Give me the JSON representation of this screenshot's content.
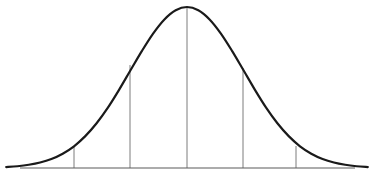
{
  "figure": {
    "background_color": "#ffffff",
    "width": 369,
    "height": 177
  },
  "style": {
    "curve_color": "#1a1a1a",
    "curve_width": 2.2,
    "baseline_color": "#5a5a5a",
    "baseline_width": 1.1,
    "gridline_color": "#6e6e6e",
    "gridline_width": 0.9
  },
  "geometry": {
    "baseline_y": 168,
    "baseline_x_start": 20,
    "baseline_x_end": 355,
    "peak_x": 187,
    "peak_y": 7,
    "curve_x_start": 17,
    "curve_x_end": 360,
    "sigma_px": 56.5
  },
  "chart_data": {
    "type": "line",
    "title": "",
    "subtitle": "",
    "xlabel": "",
    "ylabel": "",
    "legend": [],
    "legend_position": "none",
    "grid": false,
    "xlim": [
      -3.2,
      3.2
    ],
    "ylim": [
      0,
      1
    ],
    "annotations": [],
    "gridlines": {
      "orientation": "vertical",
      "label": "standard deviation markers",
      "x": [
        -2,
        -1,
        0,
        1,
        2
      ],
      "x_px": [
        74,
        130,
        187,
        243,
        296
      ],
      "top_y_px": [
        146,
        65,
        7,
        68,
        146
      ],
      "tick_labels": [
        "",
        "",
        "",
        "",
        ""
      ]
    },
    "series": [
      {
        "name": "normal-pdf",
        "x": [
          -3.2,
          -3.0,
          -2.8,
          -2.6,
          -2.4,
          -2.2,
          -2.0,
          -1.8,
          -1.6,
          -1.4,
          -1.2,
          -1.0,
          -0.8,
          -0.6,
          -0.4,
          -0.2,
          0.0,
          0.2,
          0.4,
          0.6,
          0.8,
          1.0,
          1.2,
          1.4,
          1.6,
          1.8,
          2.0,
          2.2,
          2.4,
          2.6,
          2.8,
          3.0,
          3.2
        ],
        "y": [
          0.006,
          0.011,
          0.02,
          0.034,
          0.056,
          0.089,
          0.135,
          0.198,
          0.278,
          0.375,
          0.487,
          0.607,
          0.726,
          0.835,
          0.923,
          0.98,
          1.0,
          0.98,
          0.923,
          0.835,
          0.726,
          0.607,
          0.487,
          0.375,
          0.278,
          0.198,
          0.135,
          0.089,
          0.056,
          0.034,
          0.02,
          0.011,
          0.006
        ]
      }
    ]
  }
}
